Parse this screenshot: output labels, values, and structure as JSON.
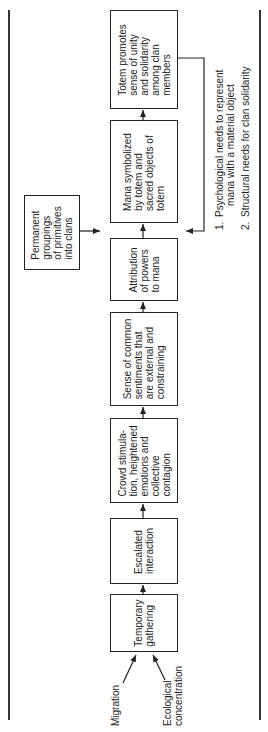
{
  "diagram": {
    "type": "flowchart",
    "orientation": "rotated-90-ccw",
    "inputs": [
      {
        "id": "migration",
        "label": "Migration"
      },
      {
        "id": "ecological",
        "label": "Ecological\nconcentration"
      }
    ],
    "steps": [
      {
        "id": "temporary",
        "label": "Temporary\ngathering"
      },
      {
        "id": "escalated",
        "label": "Escalated\ninteraction"
      },
      {
        "id": "crowd",
        "label": "Crowd stimula-\ntion, heightened\nemotions and\ncollective\ncontagion"
      },
      {
        "id": "sense",
        "label": "Sense of common\nsentiments that\nare external and\nconstraining"
      },
      {
        "id": "attribution",
        "label": "Attribution\nof powers\nto mana"
      },
      {
        "id": "mana",
        "label": "Mana symbolized\nby totem and\nsacred objects of\ntotem"
      },
      {
        "id": "totem",
        "label": "Totem promotes\nsense of unity\nand solidarity\namong clan\nmembers"
      }
    ],
    "side_input": {
      "id": "permanent",
      "label": "Permanent\ngroupings\nof primitives\ninto clans"
    },
    "feedback_notes": [
      {
        "number": "1.",
        "label": "Psychological needs to represent\n    mana with a material object"
      },
      {
        "number": "2.",
        "label": "Structural needs for clan solidarity"
      }
    ]
  }
}
